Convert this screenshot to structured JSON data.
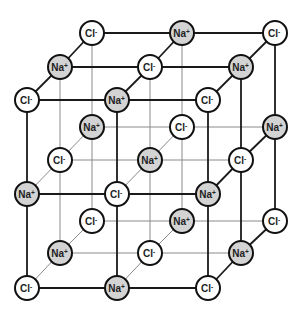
{
  "diagram": {
    "title": "",
    "colors": {
      "na_fill": "#d3d3d3",
      "cl_fill": "#ffffff",
      "outline": "#111111",
      "visible_edge": "#1a1a1a",
      "hidden_edge": "#8a8a8a"
    },
    "ion_radius": 12,
    "ion_types": {
      "Na": {
        "symbol": "Na",
        "charge": "+"
      },
      "Cl": {
        "symbol": "Cl",
        "charge": "-"
      }
    },
    "grid": {
      "size": 3,
      "layers": [
        {
          "name": "front",
          "x": [
            27,
            117,
            208
          ],
          "y": [
            100,
            194,
            288
          ]
        },
        {
          "name": "middle",
          "x": [
            60,
            150,
            241
          ],
          "y": [
            67,
            160,
            253
          ]
        },
        {
          "name": "back",
          "x": [
            92,
            182,
            275
          ],
          "y": [
            33,
            127,
            221
          ]
        }
      ]
    },
    "ions": [
      {
        "i": 0,
        "j": 0,
        "k": 0,
        "type": "Cl"
      },
      {
        "i": 1,
        "j": 0,
        "k": 0,
        "type": "Na"
      },
      {
        "i": 2,
        "j": 0,
        "k": 0,
        "type": "Cl"
      },
      {
        "i": 0,
        "j": 1,
        "k": 0,
        "type": "Na"
      },
      {
        "i": 1,
        "j": 1,
        "k": 0,
        "type": "Cl"
      },
      {
        "i": 2,
        "j": 1,
        "k": 0,
        "type": "Na"
      },
      {
        "i": 0,
        "j": 2,
        "k": 0,
        "type": "Cl"
      },
      {
        "i": 1,
        "j": 2,
        "k": 0,
        "type": "Na"
      },
      {
        "i": 2,
        "j": 2,
        "k": 0,
        "type": "Cl"
      },
      {
        "i": 0,
        "j": 0,
        "k": 1,
        "type": "Na"
      },
      {
        "i": 1,
        "j": 0,
        "k": 1,
        "type": "Cl"
      },
      {
        "i": 2,
        "j": 0,
        "k": 1,
        "type": "Na"
      },
      {
        "i": 0,
        "j": 1,
        "k": 1,
        "type": "Cl"
      },
      {
        "i": 1,
        "j": 1,
        "k": 1,
        "type": "Na"
      },
      {
        "i": 2,
        "j": 1,
        "k": 1,
        "type": "Cl"
      },
      {
        "i": 0,
        "j": 2,
        "k": 1,
        "type": "Na"
      },
      {
        "i": 1,
        "j": 2,
        "k": 1,
        "type": "Cl"
      },
      {
        "i": 2,
        "j": 2,
        "k": 1,
        "type": "Na"
      },
      {
        "i": 0,
        "j": 0,
        "k": 2,
        "type": "Cl"
      },
      {
        "i": 1,
        "j": 0,
        "k": 2,
        "type": "Na"
      },
      {
        "i": 2,
        "j": 0,
        "k": 2,
        "type": "Cl"
      },
      {
        "i": 0,
        "j": 1,
        "k": 2,
        "type": "Na"
      },
      {
        "i": 1,
        "j": 1,
        "k": 2,
        "type": "Cl"
      },
      {
        "i": 2,
        "j": 1,
        "k": 2,
        "type": "Na"
      },
      {
        "i": 0,
        "j": 2,
        "k": 2,
        "type": "Cl"
      },
      {
        "i": 1,
        "j": 2,
        "k": 2,
        "type": "Na"
      },
      {
        "i": 2,
        "j": 2,
        "k": 2,
        "type": "Cl"
      }
    ]
  }
}
